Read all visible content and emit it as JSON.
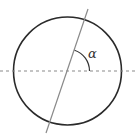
{
  "diagram": {
    "title": "",
    "angle_label": "α",
    "colors": {
      "circle": "#2a2a2a",
      "slant_line": "#8a8a8a",
      "dashed_line": "#8a8a8a",
      "arc": "#333333",
      "label": "#333333",
      "background": "#ffffff"
    },
    "elements": [
      {
        "type": "circle",
        "name": "circle",
        "center": [
          67.5,
          71
        ],
        "radius": 54
      },
      {
        "type": "dashed-line",
        "name": "horizontal-axis",
        "from": [
          0,
          71
        ],
        "to": [
          136,
          71
        ]
      },
      {
        "type": "line",
        "name": "slanted-line",
        "from": [
          88,
          9
        ],
        "to": [
          46,
          133
        ]
      },
      {
        "type": "arc",
        "name": "angle-arc",
        "center": [
          67.5,
          71
        ],
        "radius": 22,
        "label": "α"
      }
    ]
  }
}
